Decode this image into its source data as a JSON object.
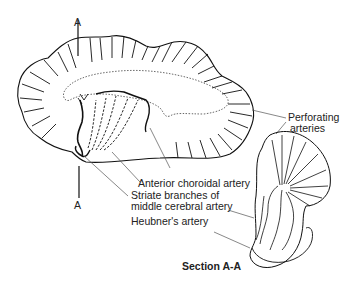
{
  "diagram": {
    "section_markers": {
      "top": "A",
      "bottom": "A"
    },
    "labels": {
      "perforating_line1": "Perforating",
      "perforating_line2": "arteries",
      "anterior_choroidal": "Anterior choroidal artery",
      "striate_line1": "Striate branches of",
      "striate_line2": "middle cerebral artery",
      "heubner": "Heubner's artery",
      "section_title": "Section A-A"
    },
    "colors": {
      "ink": "#111111",
      "leader": "#555555",
      "background": "#ffffff"
    }
  }
}
